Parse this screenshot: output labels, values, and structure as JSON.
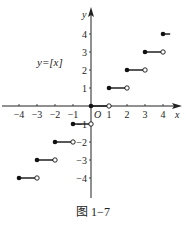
{
  "caption": "图 1−7",
  "chart_data": {
    "type": "line",
    "title": "y=[x]",
    "xlabel": "x",
    "ylabel": "y",
    "origin_label": "O",
    "xlim": [
      -4.5,
      4.5
    ],
    "ylim": [
      -4.5,
      4.5
    ],
    "x_ticks": [
      -4,
      -3,
      -2,
      -1,
      1,
      2,
      3,
      4
    ],
    "y_ticks": [
      -4,
      -3,
      -2,
      -1,
      1,
      2,
      3,
      4
    ],
    "x_tick_labels": [
      "−4",
      "−3",
      "−2",
      "−1",
      "1",
      "2",
      "3",
      "4"
    ],
    "y_tick_labels": [
      "−4",
      "−3",
      "−2",
      "−1",
      "1",
      "2",
      "3",
      "4"
    ],
    "grid": false,
    "series": [
      {
        "name": "y=[x]",
        "segments": [
          {
            "x_start": -4,
            "x_end": -3,
            "y": -4,
            "closed_start": true,
            "open_end": true
          },
          {
            "x_start": -3,
            "x_end": -2,
            "y": -3,
            "closed_start": true,
            "open_end": true
          },
          {
            "x_start": -2,
            "x_end": -1,
            "y": -2,
            "closed_start": true,
            "open_end": true
          },
          {
            "x_start": -1,
            "x_end": 0,
            "y": -1,
            "closed_start": true,
            "open_end": true
          },
          {
            "x_start": 0,
            "x_end": 1,
            "y": 0,
            "closed_start": true,
            "open_end": true
          },
          {
            "x_start": 1,
            "x_end": 2,
            "y": 1,
            "closed_start": true,
            "open_end": true
          },
          {
            "x_start": 2,
            "x_end": 3,
            "y": 2,
            "closed_start": true,
            "open_end": true
          },
          {
            "x_start": 3,
            "x_end": 4,
            "y": 3,
            "closed_start": true,
            "open_end": true
          },
          {
            "x_start": 4,
            "x_end": 4.4,
            "y": 4,
            "closed_start": true,
            "open_end": false
          }
        ]
      }
    ]
  }
}
